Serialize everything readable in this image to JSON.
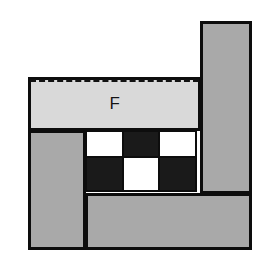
{
  "figure": {
    "title": "",
    "background_color": "#ffffff",
    "outline_color": "#0d0d0d",
    "labels": {
      "f_region": "F"
    },
    "palette": {
      "light_gray": "#d9d9d9",
      "medium_gray": "#a9a9a9",
      "black": "#1a1a1a",
      "white": "#ffffff",
      "outline": "#0d0d0d"
    },
    "regions": [
      {
        "id": "tall-right-bar",
        "name": "tall-right-bar",
        "fill": "#a9a9a9",
        "x": 200,
        "y": 21,
        "w": 52,
        "h": 173
      },
      {
        "id": "f-band",
        "name": "f-band",
        "fill": "#d9d9d9",
        "label": "F",
        "dashed_top": true,
        "x": 28,
        "y": 77,
        "w": 173,
        "h": 54
      },
      {
        "id": "left-column",
        "name": "left-column",
        "fill": "#a9a9a9",
        "x": 28,
        "y": 130,
        "w": 58,
        "h": 120
      },
      {
        "id": "bottom-band",
        "name": "bottom-band",
        "fill": "#a9a9a9",
        "x": 85,
        "y": 193,
        "w": 167,
        "h": 57
      }
    ],
    "checkerboard": {
      "name": "checkerboard",
      "x": 85,
      "y": 130,
      "w": 116,
      "h": 64,
      "columns": 3,
      "rows": 2,
      "col_widths": [
        39,
        38,
        39
      ],
      "row_heights": [
        28,
        36
      ],
      "cells": [
        [
          "white",
          "black",
          "white"
        ],
        [
          "black",
          "white",
          "black"
        ]
      ]
    }
  }
}
